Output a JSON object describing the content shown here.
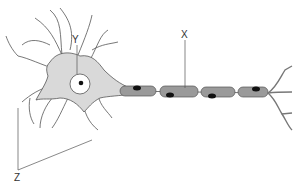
{
  "diagram": {
    "labels": {
      "x": "X",
      "y": "Y",
      "z": "Z"
    },
    "parts": [
      {
        "label": "X",
        "points_to": "axon with myelin sheath"
      },
      {
        "label": "Y",
        "points_to": "nucleus in cell body"
      },
      {
        "label": "Z",
        "points_to": "dendrites"
      }
    ],
    "colors": {
      "cell_body_fill": "#d9d9d9",
      "myelin_fill": "#9a9a9a",
      "nucleus_fill": "#ffffff",
      "node_dot": "#111111",
      "outline": "#555555",
      "label_text": "#333333"
    }
  }
}
